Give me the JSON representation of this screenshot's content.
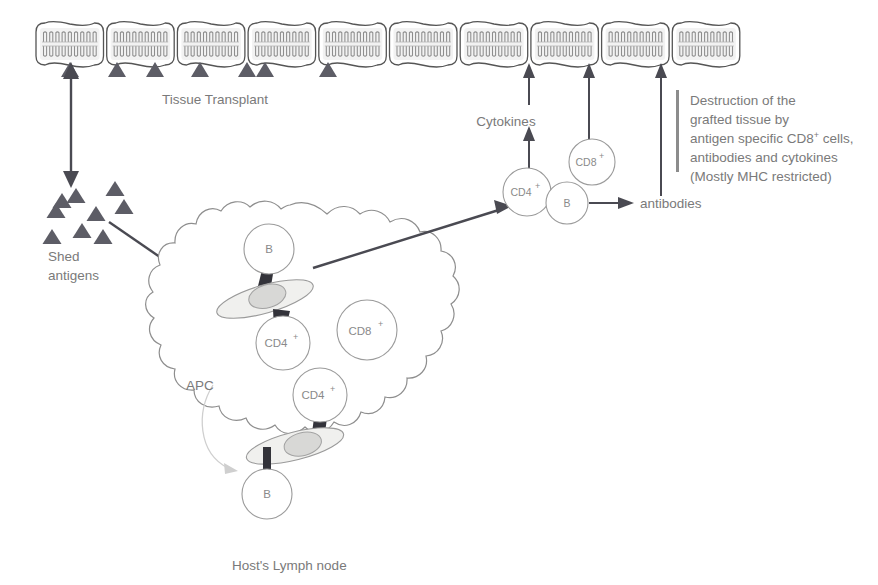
{
  "figure": {
    "type": "biological-process-diagram"
  },
  "labels": {
    "tissue_transplant": "Tissue Transplant",
    "shed_antigens_line1": "Shed",
    "shed_antigens_line2": "antigens",
    "host_lymph_node": "Host's Lymph node",
    "apc": "APC",
    "cytokines": "Cytokines",
    "antibodies": "antibodies",
    "destruction": {
      "line1": "Destruction of the",
      "line2": "grafted tissue by",
      "line3_a": "antigen specific CD8",
      "line3_sup": "+",
      "line3_b": " cells,",
      "line4": "antibodies and cytokines",
      "line5": "(Mostly MHC restricted)"
    }
  },
  "cells": {
    "b_upper": {
      "label": "B"
    },
    "b_lower": {
      "label": "B"
    },
    "b_right": {
      "label": "B"
    },
    "cd4_upper": {
      "label": "CD4",
      "sup": "+"
    },
    "cd4_lower": {
      "label": "CD4",
      "sup": "+"
    },
    "cd4_right": {
      "label": "CD4",
      "sup": "+"
    },
    "cd8_node": {
      "label": "CD8",
      "sup": "+"
    },
    "cd8_right": {
      "label": "CD8",
      "sup": "+"
    }
  },
  "tissue": {
    "cell_count": 10,
    "description": "row of graft tissue cells with lipid bilayer membranes"
  },
  "antigen_markers": {
    "on_tissue_count": 7,
    "shed_pool_count": 9
  },
  "colors": {
    "text": "#7a7a7a",
    "cell_outline": "#9b9b9b",
    "arrow": "#4a4a52",
    "membrane_outline": "#555555",
    "membrane_fill": "#f2f2f2",
    "apc_fill": "#f0f0ee",
    "apc_nucleus": "#d8d8d6",
    "lymph_outline": "#8e8e8e",
    "antigen": "#5d5d66",
    "background": "#ffffff"
  }
}
